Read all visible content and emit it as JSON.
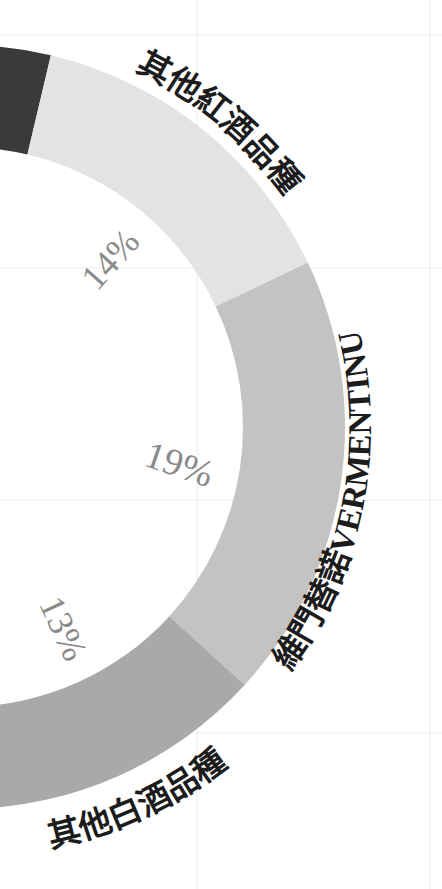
{
  "chart_data": {
    "type": "pie",
    "variant": "donut",
    "title": "",
    "categories": [
      "其他紅酒品種",
      "維門替諾VERMENTINU",
      "其他白酒品種"
    ],
    "values": [
      14,
      19,
      13
    ],
    "value_labels": [
      "14%",
      "19%",
      "13%"
    ],
    "colors": [
      "#e3e3e3",
      "#c3c3c3",
      "#a9a9a9"
    ],
    "partial_segments": [
      {
        "name": "unlabeled-dark-segment",
        "color": "#3a3a3a",
        "visible_label": null
      }
    ],
    "grid": true,
    "legend": "none",
    "cropped": true
  },
  "geometry": {
    "cx": -37,
    "cy": 427,
    "outer_r": 382,
    "inner_r": 280,
    "start_deg": 13.3
  },
  "segments": [
    {
      "id": "dark",
      "color": "#3a3a3a",
      "from": -60,
      "to": 13.3
    },
    {
      "id": "other-red",
      "color": "#e3e3e3",
      "from": 13.3,
      "to": 64.5
    },
    {
      "id": "vermentino",
      "color": "#c3c3c3",
      "from": 64.5,
      "to": 132.5
    },
    {
      "id": "other-white",
      "color": "#a9a9a9",
      "from": 132.5,
      "to": 179.3
    }
  ],
  "labels": {
    "other_red": {
      "text": "其他紅酒品種",
      "radius": 396,
      "from": 22,
      "to": 58,
      "size": 33,
      "clockwise": true
    },
    "vermentino": {
      "text": "維門替諾",
      "latin": "VERMENTINU",
      "radius": 408,
      "from": 131,
      "to": 72,
      "size": 33,
      "clockwise": false
    },
    "other_white": {
      "text": "其他白酒品種",
      "radius": 430,
      "from": 170,
      "to": 140,
      "size": 33,
      "clockwise": false
    }
  },
  "percent_labels": [
    {
      "text": "14%",
      "x": 113,
      "y": 262,
      "rotate": -48,
      "size": 36
    },
    {
      "text": "19%",
      "x": 178,
      "y": 468,
      "rotate": 19,
      "size": 38
    },
    {
      "text": "13%",
      "x": 60,
      "y": 630,
      "rotate": 65,
      "size": 36
    }
  ],
  "grid": {
    "h": [
      35,
      268,
      500,
      733
    ],
    "v": [
      197,
      430
    ]
  }
}
